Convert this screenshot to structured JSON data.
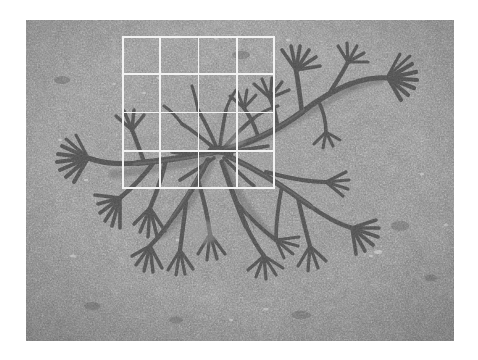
{
  "page": {
    "canvas_width": 478,
    "canvas_height": 360,
    "background_color": "#ffffff"
  },
  "photo": {
    "name": "underwater-seaweed-photograph",
    "alt_text": "Branching dark brown seaweed (fucoid alga) lying on a grey sandy seabed",
    "x": 26,
    "y": 20,
    "width": 428,
    "height": 321,
    "rendering": "grayscale",
    "substrate_color": "#8b8b8b",
    "substrate_dark_color": "#6f6f6f",
    "substrate_light_color": "#a6a6a6",
    "specimen_color": "#4a4a4a",
    "specimen_mid_color": "#5c5c5c",
    "specimen_light_color": "#6b6b6b"
  },
  "grid_overlay": {
    "name": "measurement-grid",
    "color": "#f2f2f2",
    "line_width": 1.6,
    "columns": 4,
    "rows": 4,
    "cell_size": 38.25,
    "x": 122,
    "y": 36,
    "width": 153,
    "height": 153,
    "vertical_line_x": [
      0,
      38.25,
      76.5,
      114.75,
      153
    ],
    "horizontal_line_y": [
      0,
      38.25,
      76.5,
      114.75,
      153
    ]
  },
  "chart_data": {
    "type": "table",
    "categories": [
      "col-1",
      "col-2",
      "col-3",
      "col-4"
    ],
    "values": [
      4,
      4,
      4,
      4
    ]
  }
}
